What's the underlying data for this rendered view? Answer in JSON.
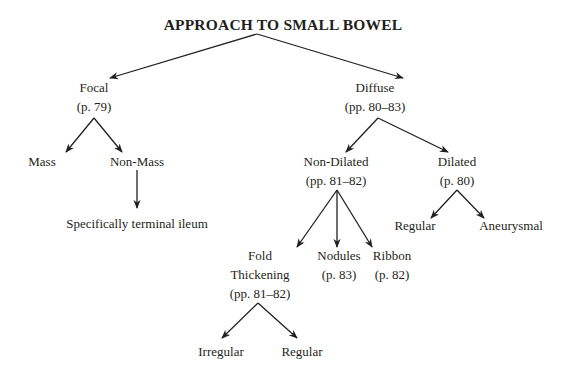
{
  "diagram": {
    "title": "APPROACH TO SMALL BOWEL",
    "line_color": "#231f20",
    "nodes": {
      "focal": {
        "label": "Focal",
        "ref": "(p. 79)"
      },
      "diffuse": {
        "label": "Diffuse",
        "ref": "(pp. 80–83)"
      },
      "mass": {
        "label": "Mass"
      },
      "non_mass": {
        "label": "Non-Mass"
      },
      "terminal_ileum": {
        "label": "Specifically terminal ileum"
      },
      "non_dilated": {
        "label": "Non-Dilated",
        "ref": "(pp. 81–82)"
      },
      "dilated": {
        "label": "Dilated",
        "ref": "(p. 80)"
      },
      "dilated_regular": {
        "label": "Regular"
      },
      "aneurysmal": {
        "label": "Aneurysmal"
      },
      "fold_thickening": {
        "label_line1": "Fold",
        "label_line2": "Thickening",
        "ref": "(pp. 81–82)"
      },
      "nodules": {
        "label": "Nodules",
        "ref": "(p. 83)"
      },
      "ribbon": {
        "label": "Ribbon",
        "ref": "(p. 82)"
      },
      "irregular": {
        "label": "Irregular"
      },
      "fold_regular": {
        "label": "Regular"
      }
    },
    "edges": [
      [
        "title",
        "focal"
      ],
      [
        "title",
        "diffuse"
      ],
      [
        "focal",
        "mass"
      ],
      [
        "focal",
        "non_mass"
      ],
      [
        "non_mass",
        "terminal_ileum"
      ],
      [
        "diffuse",
        "non_dilated"
      ],
      [
        "diffuse",
        "dilated"
      ],
      [
        "dilated",
        "dilated_regular"
      ],
      [
        "dilated",
        "aneurysmal"
      ],
      [
        "non_dilated",
        "fold_thickening"
      ],
      [
        "non_dilated",
        "nodules"
      ],
      [
        "non_dilated",
        "ribbon"
      ],
      [
        "fold_thickening",
        "irregular"
      ],
      [
        "fold_thickening",
        "fold_regular"
      ]
    ]
  }
}
